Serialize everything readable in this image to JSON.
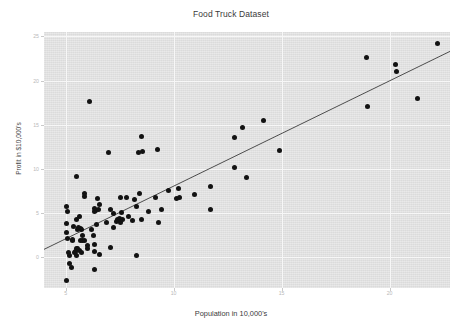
{
  "chart_data": {
    "type": "scatter",
    "title": "Food Truck Dataset",
    "xlabel": "Population in 10,000's",
    "ylabel": "Profit in $10,000's",
    "xlim": [
      4.0,
      22.8
    ],
    "ylim": [
      -3.5,
      25.5
    ],
    "xticks": [
      5,
      10,
      15,
      20
    ],
    "xticklabels": [
      "5",
      "10",
      "15",
      "20"
    ],
    "yticks": [
      0,
      5,
      10,
      15,
      20,
      25
    ],
    "yticklabels": [
      "0",
      "5",
      "10",
      "15",
      "20",
      "25"
    ],
    "grid": true,
    "legend": "none",
    "marker_color": "#121212",
    "line_color": "#4d4d4d",
    "panel_color": "#e2e2e2",
    "gridline_color": "#f7f7f7",
    "series": [
      {
        "name": "Training data",
        "type": "scatter",
        "points": [
          [
            6.1101,
            17.592
          ],
          [
            5.5277,
            9.1302
          ],
          [
            8.5186,
            13.662
          ],
          [
            7.0032,
            11.854
          ],
          [
            5.8598,
            6.8233
          ],
          [
            8.3829,
            11.886
          ],
          [
            7.4764,
            4.3483
          ],
          [
            8.5781,
            12.0
          ],
          [
            6.4862,
            6.5987
          ],
          [
            5.0546,
            3.8166
          ],
          [
            5.7107,
            3.2522
          ],
          [
            14.164,
            15.505
          ],
          [
            5.734,
            3.1551
          ],
          [
            8.4084,
            7.2258
          ],
          [
            5.6407,
            0.71618
          ],
          [
            5.3794,
            3.5129
          ],
          [
            6.3654,
            5.3048
          ],
          [
            5.1301,
            0.56077
          ],
          [
            6.4296,
            3.6518
          ],
          [
            7.0708,
            5.3893
          ],
          [
            6.1891,
            3.1386
          ],
          [
            20.27,
            21.767
          ],
          [
            5.4901,
            4.263
          ],
          [
            6.3261,
            5.1875
          ],
          [
            5.5649,
            3.0825
          ],
          [
            18.945,
            22.638
          ],
          [
            12.828,
            13.501
          ],
          [
            10.957,
            7.0467
          ],
          [
            13.176,
            14.692
          ],
          [
            22.203,
            24.147
          ],
          [
            5.2524,
            -1.22
          ],
          [
            6.5894,
            5.9966
          ],
          [
            9.2482,
            12.134
          ],
          [
            5.8918,
            1.8495
          ],
          [
            8.2111,
            6.5426
          ],
          [
            7.9334,
            4.5623
          ],
          [
            8.0959,
            4.1164
          ],
          [
            5.6063,
            3.3928
          ],
          [
            12.836,
            10.117
          ],
          [
            6.3534,
            5.4974
          ],
          [
            5.4069,
            0.55657
          ],
          [
            6.8825,
            3.9115
          ],
          [
            11.708,
            5.3854
          ],
          [
            5.7737,
            2.4406
          ],
          [
            7.8247,
            6.7318
          ],
          [
            7.0931,
            1.0463
          ],
          [
            5.0702,
            5.1337
          ],
          [
            5.8014,
            1.844
          ],
          [
            11.7,
            8.0043
          ],
          [
            5.5416,
            1.0179
          ],
          [
            7.5402,
            6.7504
          ],
          [
            5.3077,
            1.8396
          ],
          [
            7.4239,
            4.2885
          ],
          [
            7.6031,
            4.9981
          ],
          [
            6.3328,
            1.4233
          ],
          [
            6.3589,
            -1.4211
          ],
          [
            6.2742,
            2.4756
          ],
          [
            5.6397,
            4.6042
          ],
          [
            9.3102,
            3.9624
          ],
          [
            9.4536,
            5.4141
          ],
          [
            8.8254,
            5.1694
          ],
          [
            5.1793,
            -0.74279
          ],
          [
            21.279,
            17.929
          ],
          [
            14.908,
            12.054
          ],
          [
            18.959,
            17.054
          ],
          [
            7.2182,
            4.8852
          ],
          [
            8.2951,
            5.7442
          ],
          [
            10.236,
            7.7754
          ],
          [
            5.4994,
            1.0173
          ],
          [
            20.341,
            20.992
          ],
          [
            10.136,
            6.6799
          ],
          [
            7.3345,
            4.0259
          ],
          [
            6.0062,
            1.2784
          ],
          [
            7.2259,
            3.3411
          ],
          [
            5.0269,
            -2.6807
          ],
          [
            6.5479,
            0.29678
          ],
          [
            7.5386,
            3.8845
          ],
          [
            5.0365,
            5.7014
          ],
          [
            10.274,
            6.7526
          ],
          [
            5.1077,
            2.0576
          ],
          [
            5.7292,
            0.47953
          ],
          [
            5.1884,
            0.20421
          ],
          [
            6.3557,
            0.67861
          ],
          [
            9.7687,
            7.5435
          ],
          [
            6.5159,
            5.3436
          ],
          [
            8.5172,
            4.2415
          ],
          [
            9.1802,
            6.7981
          ],
          [
            6.002,
            0.92695
          ],
          [
            5.5204,
            0.152
          ],
          [
            5.0594,
            2.8214
          ],
          [
            5.7077,
            1.8451
          ],
          [
            7.6366,
            4.2959
          ],
          [
            5.8707,
            7.2029
          ],
          [
            5.3054,
            1.9869
          ],
          [
            8.2934,
            0.14454
          ],
          [
            13.394,
            9.0551
          ],
          [
            5.4369,
            0.61705
          ]
        ]
      },
      {
        "name": "Linear regression fit",
        "type": "line",
        "slope": 1.1931,
        "intercept": -3.8958,
        "endpoints": [
          [
            4.0,
            0.8766
          ],
          [
            22.8,
            23.3069
          ]
        ]
      }
    ]
  }
}
